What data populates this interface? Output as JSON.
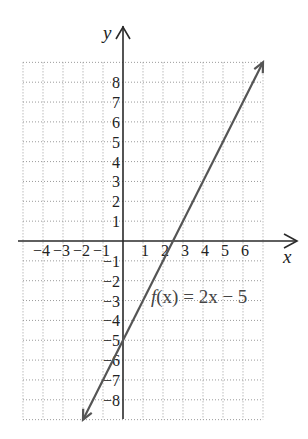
{
  "chart_data": {
    "type": "line",
    "title": "",
    "xlabel": "x",
    "ylabel": "y",
    "xlim": [
      -5,
      7
    ],
    "ylim": [
      -9,
      9
    ],
    "grid": true,
    "grid_style": "dotted",
    "x_ticks": [
      -4,
      -3,
      -2,
      -1,
      1,
      2,
      3,
      4,
      5,
      6
    ],
    "x_tick_labels": [
      "−4",
      "−3",
      "−2",
      "−1",
      "1",
      "2",
      "3",
      "4",
      "5",
      "6"
    ],
    "y_ticks": [
      8,
      7,
      6,
      5,
      4,
      3,
      2,
      1,
      -1,
      -2,
      -3,
      -4,
      -5,
      -6,
      -7,
      -8
    ],
    "y_tick_labels": [
      "8",
      "7",
      "6",
      "5",
      "4",
      "3",
      "2",
      "1",
      "−1",
      "−2",
      "−3",
      "−4",
      "−5",
      "−6",
      "−7",
      "−8"
    ],
    "series": [
      {
        "name": "f(x) = 2x − 5",
        "equation": "f(x) = 2x - 5",
        "slope": 2,
        "intercept": -5,
        "x": [
          -2,
          7
        ],
        "values": [
          -9,
          9
        ],
        "arrows": "both",
        "color": "#555555"
      }
    ],
    "annotations": [
      {
        "text": "f(x) = 2x − 5",
        "x": 1.5,
        "y": -3
      }
    ]
  },
  "labels": {
    "x_axis": "x",
    "y_axis": "y",
    "function_f": "f",
    "function_rest": "(x) = 2x − 5"
  }
}
